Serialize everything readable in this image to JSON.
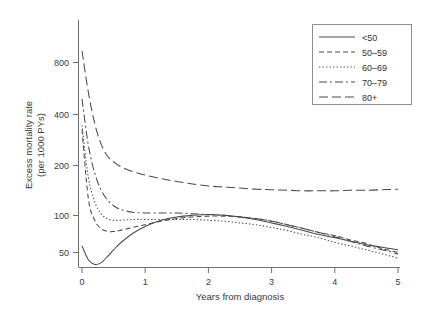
{
  "chart_data": {
    "type": "line",
    "title": "",
    "xlabel": "Years from diagnosis",
    "ylabel_line1": "Excess mortality rate",
    "ylabel_line2": "(per 1000 PYs)",
    "yscale": "log",
    "xscale": "linear",
    "xlim": [
      0,
      5
    ],
    "ylim": [
      38,
      980
    ],
    "xticks": [
      0,
      1,
      2,
      3,
      4,
      5
    ],
    "xtick_labels": [
      "0",
      "1",
      "2",
      "3",
      "4",
      "5"
    ],
    "yticks": [
      50,
      100,
      200,
      400,
      800
    ],
    "ytick_labels": [
      "50",
      "100",
      "200",
      "400",
      "800"
    ],
    "grid": false,
    "legend_position": "top-right",
    "legend_title": "",
    "x": [
      0,
      0.1,
      0.2,
      0.3,
      0.4,
      0.5,
      0.6,
      0.8,
      1.0,
      1.25,
      1.5,
      1.75,
      2.0,
      2.25,
      2.5,
      2.75,
      3.0,
      3.25,
      3.5,
      3.75,
      4.0,
      4.25,
      4.5,
      4.75,
      5.0
    ],
    "series": [
      {
        "name": "<50",
        "linestyle": "solid",
        "dash": "none",
        "values": [
          55,
          45,
          42,
          43,
          47,
          52,
          57,
          66,
          73,
          80,
          84,
          86,
          87,
          86,
          84,
          81,
          77,
          73,
          69,
          65,
          62,
          59,
          56,
          54,
          52
        ]
      },
      {
        "name": "50-59",
        "linestyle": "dashed",
        "dash": "5,3",
        "values": [
          300,
          110,
          80,
          71,
          68,
          68,
          69,
          72,
          75,
          79,
          82,
          84,
          85,
          85,
          84,
          82,
          79,
          75,
          71,
          67,
          64,
          60,
          57,
          53,
          50
        ]
      },
      {
        "name": "60-69",
        "linestyle": "dotted",
        "dash": "1.4,2.1",
        "values": [
          320,
          150,
          105,
          88,
          82,
          80,
          80,
          81,
          81,
          81,
          81,
          81,
          80,
          79,
          77,
          75,
          72,
          69,
          65,
          62,
          58,
          55,
          52,
          49,
          46
        ]
      },
      {
        "name": "70-79",
        "linestyle": "dashdot",
        "dash": "8,3,2,3",
        "values": [
          470,
          240,
          160,
          125,
          108,
          99,
          94,
          90,
          89,
          89,
          89,
          88,
          87,
          86,
          84,
          82,
          79,
          75,
          71,
          67,
          63,
          59,
          55,
          52,
          49
        ]
      },
      {
        "name": "80+",
        "linestyle": "longdash",
        "dash": "9,4",
        "values": [
          950,
          520,
          330,
          245,
          205,
          188,
          176,
          163,
          155,
          147,
          141,
          136,
          132,
          130,
          128,
          126,
          125,
          124,
          123,
          123,
          123,
          124,
          124,
          125,
          126
        ]
      }
    ],
    "notes": {
      "solid_minimum": "~42 at 0.2 years",
      "solid_peak": "~87 at 1.9 years",
      "convergence": "all age groups converge near 85 per 1000 PYs around 2 years",
      "endpoint_80plus": "~126 at 5 years, remains highest"
    }
  },
  "legend": {
    "entries": [
      {
        "label": "<50"
      },
      {
        "label": "50–59"
      },
      {
        "label": "60–69"
      },
      {
        "label": "70–79"
      },
      {
        "label": "80+"
      }
    ]
  }
}
